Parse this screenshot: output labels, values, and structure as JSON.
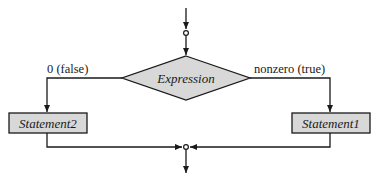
{
  "diagram": {
    "type": "flowchart",
    "decision": {
      "label": "Expression"
    },
    "branches": {
      "false": {
        "label": "0 (false)",
        "statement": "Statement2"
      },
      "true": {
        "label": "nonzero (true)",
        "statement": "Statement1"
      }
    },
    "colors": {
      "fill": "#d8d8d8",
      "stroke": "#1a1a1a",
      "background": "#ffffff"
    },
    "nodes": [
      {
        "id": "entry",
        "kind": "connector"
      },
      {
        "id": "decision",
        "kind": "diamond",
        "label": "Expression"
      },
      {
        "id": "s2",
        "kind": "process",
        "label": "Statement2"
      },
      {
        "id": "s1",
        "kind": "process",
        "label": "Statement1"
      },
      {
        "id": "join",
        "kind": "connector"
      }
    ],
    "edges": [
      {
        "from": "entry",
        "to": "decision"
      },
      {
        "from": "decision",
        "to": "s2",
        "label": "0 (false)"
      },
      {
        "from": "decision",
        "to": "s1",
        "label": "nonzero (true)"
      },
      {
        "from": "s2",
        "to": "join"
      },
      {
        "from": "s1",
        "to": "join"
      },
      {
        "from": "join",
        "to": "exit"
      }
    ]
  }
}
